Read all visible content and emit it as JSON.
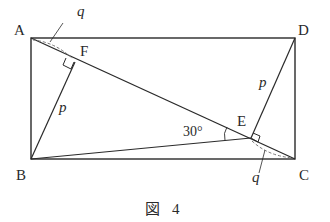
{
  "figure": {
    "caption": "図 4",
    "caption_kanji": "図",
    "caption_number": "4"
  },
  "points": {
    "A": {
      "label": "A",
      "x": 31,
      "y": 38
    },
    "B": {
      "label": "B",
      "x": 31,
      "y": 159
    },
    "C": {
      "label": "C",
      "x": 295,
      "y": 159
    },
    "D": {
      "label": "D",
      "x": 295,
      "y": 38
    },
    "E": {
      "label": "E",
      "x": 251,
      "y": 138
    },
    "F": {
      "label": "F",
      "x": 75,
      "y": 62
    }
  },
  "segment_labels": {
    "BF": "p",
    "DE": "p",
    "AF": "q",
    "EC": "q"
  },
  "angle": {
    "label": "30°",
    "vertex": "E",
    "between": [
      "EB",
      "EA"
    ]
  },
  "right_angles": [
    "F",
    "E"
  ],
  "colors": {
    "stroke": "#2a2a2a",
    "dashed": "#777777",
    "background": "#ffffff"
  }
}
